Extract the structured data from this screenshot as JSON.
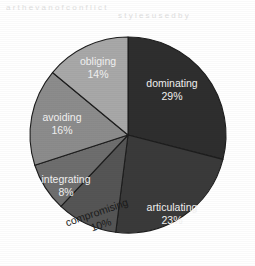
{
  "chart_data": {
    "type": "pie",
    "title": "",
    "subtitle": "",
    "xlabel": "",
    "ylabel": "",
    "legend_position": "none",
    "grid": false,
    "label_format": "name and percent inside slice",
    "start_angle_deg": 0,
    "direction": "clockwise",
    "categories": [
      "dominating",
      "articulating",
      "compromising",
      "integrating",
      "avoiding",
      "obliging"
    ],
    "values": [
      29,
      23,
      10,
      8,
      16,
      14
    ],
    "units": "%",
    "total": 100,
    "slices": [
      {
        "label": "dominating",
        "percent_text": "29%",
        "value": 29,
        "color": "#2e2e2e",
        "label_color": "light",
        "label_x": 172,
        "label_y": 84
      },
      {
        "label": "articulating",
        "percent_text": "23%",
        "value": 23,
        "color": "#3a3a3a",
        "label_color": "light",
        "label_x": 172,
        "label_y": 208
      },
      {
        "label": "compromising",
        "percent_text": "10%",
        "value": 10,
        "color": "#555555",
        "label_color": "dark",
        "label_x": 97,
        "label_y": 213
      },
      {
        "label": "integrating",
        "percent_text": "8%",
        "value": 8,
        "color": "#6e6e6e",
        "label_color": "light",
        "label_x": 66,
        "label_y": 180
      },
      {
        "label": "avoiding",
        "percent_text": "16%",
        "value": 16,
        "color": "#8c8c8c",
        "label_color": "light",
        "label_x": 62,
        "label_y": 118
      },
      {
        "label": "obliging",
        "percent_text": "14%",
        "value": 14,
        "color": "#a8a8a8",
        "label_color": "light",
        "label_x": 98,
        "label_y": 62
      }
    ],
    "geometry": {
      "center_x": 128,
      "center_y": 135,
      "radius": 98
    },
    "background_color": "#ffffff",
    "separator_color": "#1d1d1d"
  },
  "artifacts": {
    "ghost_line_1": "a  r t  h e   v a n  o f   c o n f l i c t",
    "ghost_line_2": "s t y l e s   u s e d   b y"
  }
}
